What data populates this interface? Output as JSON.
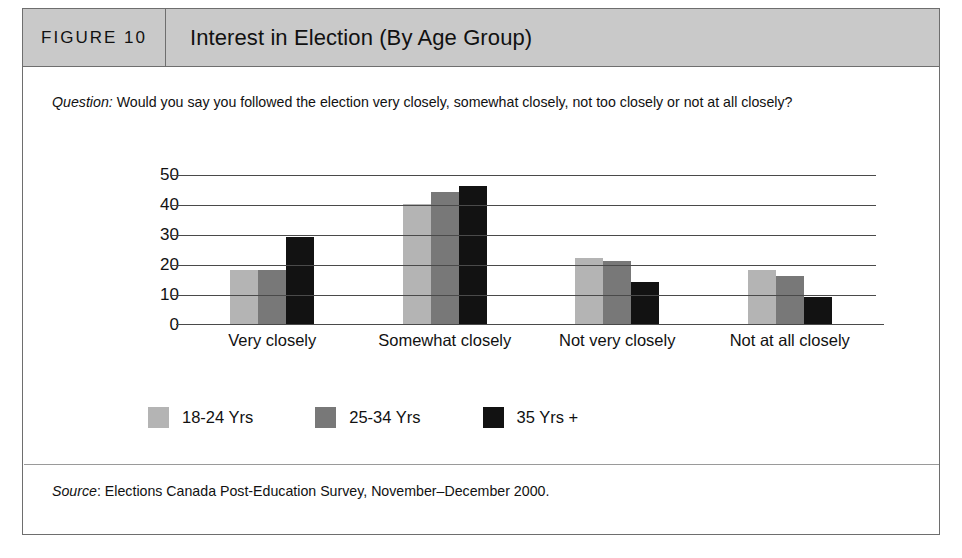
{
  "figure": {
    "number_label": "FIGURE 10",
    "title": "Interest in Election (By Age Group)",
    "question_label": "Question:",
    "question_text": " Would you say you followed the election very closely, somewhat closely, not too closely or not at all closely?",
    "source_label": "Source",
    "source_text": ": Elections Canada Post-Education Survey, November–December 2000."
  },
  "colors": {
    "series_18_24": "#b4b4b4",
    "series_25_34": "#787878",
    "series_35_plus": "#121212",
    "header_band": "#c9c9c9",
    "frame_border": "#6e6e6e",
    "gridline": "#4a4a4a"
  },
  "chart_data": {
    "type": "bar",
    "title": "Interest in Election (By Age Group)",
    "xlabel": "",
    "ylabel": "",
    "ylim": [
      0,
      50
    ],
    "yticks": [
      50,
      40,
      30,
      20,
      10,
      0
    ],
    "grid": true,
    "legend_position": "bottom-left",
    "categories": [
      "Very closely",
      "Somewhat closely",
      "Not very closely",
      "Not at all closely"
    ],
    "series": [
      {
        "name": "18-24 Yrs",
        "color": "#b4b4b4",
        "values": [
          18,
          40,
          22,
          18
        ]
      },
      {
        "name": "25-34 Yrs",
        "color": "#787878",
        "values": [
          18,
          44,
          21,
          16
        ]
      },
      {
        "name": "35 Yrs +",
        "color": "#121212",
        "values": [
          29,
          46,
          14,
          9
        ]
      }
    ]
  }
}
